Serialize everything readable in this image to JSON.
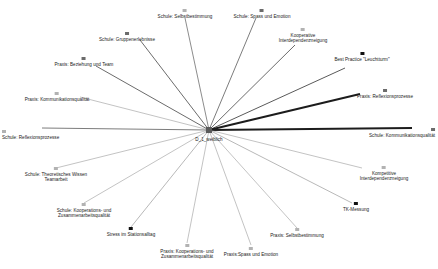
{
  "graph": {
    "title": "Egozentriertes Netzwerkdiagramm",
    "center": {
      "id": "ego",
      "label": "D_1_weiblich",
      "x": 209,
      "y": 130,
      "label_x": 209,
      "label_y": 133
    },
    "colors": {
      "edge_strong": "#1c1c1c",
      "edge_medium": "#5a5a5a",
      "edge_weak": "#9a9a9a",
      "edge_faint": "#bdbdbd",
      "node_dark": "#111111",
      "node_mid": "#6b6b6b",
      "node_light": "#b2b2b2",
      "background": "#ffffff",
      "text": "#1a1a1a"
    },
    "nodes": [
      {
        "id": "schule-selbstbestimmung",
        "label": "Schule: Selbstbestimmung",
        "x": 185,
        "y": 9,
        "align": "center",
        "tone": "light",
        "edge_weight": 0.7,
        "edge_tone": "edge_medium",
        "anchor_x": 185,
        "anchor_y": 18
      },
      {
        "id": "schule-spass-und-emotion",
        "label": "Schule: Spass und Emotion",
        "x": 262,
        "y": 9,
        "align": "center",
        "tone": "mid",
        "edge_weight": 0.8,
        "edge_tone": "edge_medium",
        "anchor_x": 256,
        "anchor_y": 18
      },
      {
        "id": "kooperative-interdependenzneigung",
        "label": "Kooperative\nInterdependenzneigung",
        "x": 303,
        "y": 28,
        "align": "center",
        "tone": "light",
        "edge_weight": 0.9,
        "edge_tone": "edge_medium",
        "anchor_x": 295,
        "anchor_y": 45
      },
      {
        "id": "best-practice-leuchtturm",
        "label": "Best Practice \"Leuchtturm\"",
        "x": 362,
        "y": 52,
        "align": "center",
        "tone": "dark",
        "edge_weight": 1.0,
        "edge_tone": "edge_medium",
        "anchor_x": 345,
        "anchor_y": 68
      },
      {
        "id": "praxis-reflexionsprozesse",
        "label": "Praxis: Reflexionsprozesse",
        "x": 385,
        "y": 89,
        "align": "center",
        "tone": "mid",
        "edge_weight": 2.0,
        "edge_tone": "edge_strong",
        "anchor_x": 360,
        "anchor_y": 94
      },
      {
        "id": "schule-kommunikationsqualitaet",
        "label": "Schule: Kommunikationsqualität",
        "x": 435,
        "y": 128,
        "align": "right",
        "tone": "mid",
        "edge_weight": 2.0,
        "edge_tone": "edge_strong",
        "anchor_x": 412,
        "anchor_y": 128
      },
      {
        "id": "kompetitive-interdependenzneigung",
        "label": "Kompetitive\nInterdependenzneigung",
        "x": 384,
        "y": 166,
        "align": "center",
        "tone": "light",
        "edge_weight": 0.6,
        "edge_tone": "edge_weak",
        "anchor_x": 362,
        "anchor_y": 168
      },
      {
        "id": "tk-messung",
        "label": "TK-Messung",
        "x": 356,
        "y": 202,
        "align": "center",
        "tone": "dark",
        "edge_weight": 0.7,
        "edge_tone": "edge_weak",
        "anchor_x": 352,
        "anchor_y": 203
      },
      {
        "id": "praxis-selbstbestimmung",
        "label": "Praxis: Selbstbestimmung",
        "x": 297,
        "y": 228,
        "align": "center",
        "tone": "light",
        "edge_weight": 0.6,
        "edge_tone": "edge_weak",
        "anchor_x": 297,
        "anchor_y": 228
      },
      {
        "id": "praxis-spass-und-emotion",
        "label": "Praxis:Spass und Emotion",
        "x": 251,
        "y": 247,
        "align": "center",
        "tone": "light",
        "edge_weight": 0.6,
        "edge_tone": "edge_weak",
        "anchor_x": 251,
        "anchor_y": 245
      },
      {
        "id": "praxis-kooperations-zusammenarbeit",
        "label": "Praxis: Kooperations- und\nZusammenarbeitsqualität",
        "x": 187,
        "y": 244,
        "align": "center",
        "tone": "light",
        "edge_weight": 0.6,
        "edge_tone": "edge_weak",
        "anchor_x": 187,
        "anchor_y": 243
      },
      {
        "id": "stress-im-stationsalltag",
        "label": "Stress im Stationsalltag",
        "x": 131,
        "y": 227,
        "align": "center",
        "tone": "dark",
        "edge_weight": 0.7,
        "edge_tone": "edge_weak",
        "anchor_x": 131,
        "anchor_y": 227
      },
      {
        "id": "schule-kooperations-zusammenarbeit",
        "label": "Schule: Kooperations- und\nZusammenarbeitsqualität",
        "x": 84,
        "y": 203,
        "align": "center",
        "tone": "light",
        "edge_weight": 0.6,
        "edge_tone": "edge_weak",
        "anchor_x": 84,
        "anchor_y": 203
      },
      {
        "id": "schule-theoretisches-wissen",
        "label": "Schule: Theoretisches Wissen\nTeamarbeit",
        "x": 56,
        "y": 167,
        "align": "center",
        "tone": "light",
        "edge_weight": 0.6,
        "edge_tone": "edge_weak",
        "anchor_x": 56,
        "anchor_y": 168
      },
      {
        "id": "schule-reflexionsprozesse",
        "label": "Schule: Reflexionsprozesse",
        "x": 2,
        "y": 130,
        "align": "left",
        "tone": "light",
        "edge_weight": 0.8,
        "edge_tone": "edge_medium",
        "anchor_x": 42,
        "anchor_y": 128
      },
      {
        "id": "praxis-kommunikationsqualitaet",
        "label": "Praxis: Kommunikationsqualität",
        "x": 57,
        "y": 92,
        "align": "center",
        "tone": "light",
        "edge_weight": 0.6,
        "edge_tone": "edge_weak",
        "anchor_x": 80,
        "anchor_y": 97
      },
      {
        "id": "praxis-beziehung-und-team",
        "label": "Praxis: Beziehung und Team",
        "x": 84,
        "y": 57,
        "align": "center",
        "tone": "mid",
        "edge_weight": 0.9,
        "edge_tone": "edge_medium",
        "anchor_x": 96,
        "anchor_y": 66
      },
      {
        "id": "schule-gruppenerlebnisse",
        "label": "Schule: Gruppenerlebnisse",
        "x": 127,
        "y": 32,
        "align": "center",
        "tone": "mid",
        "edge_weight": 0.9,
        "edge_tone": "edge_medium",
        "anchor_x": 140,
        "anchor_y": 40
      }
    ]
  }
}
